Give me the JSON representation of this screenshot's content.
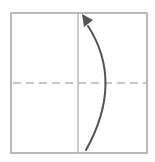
{
  "diagram": {
    "type": "origami-fold-step",
    "colors": {
      "background": "#ffffff",
      "paper_edge": "#a8a8a8",
      "crease_line": "#a8a8a8",
      "fold_line": "#b4b4b4",
      "arrow": "#555555"
    },
    "paper": {
      "x": 11,
      "y": 13,
      "width": 136,
      "height": 140
    },
    "crease": {
      "orientation": "vertical",
      "x": 78,
      "y1": 13,
      "y2": 153,
      "style": "solid"
    },
    "fold_line": {
      "orientation": "horizontal",
      "y": 83,
      "x1": 11,
      "x2": 147,
      "style": "dashed",
      "kind": "valley-fold"
    },
    "arrow": {
      "direction": "up",
      "start": {
        "x": 86,
        "y": 150
      },
      "control": {
        "x": 124,
        "y": 82
      },
      "end": {
        "x": 84,
        "y": 18
      },
      "head_tip": {
        "x": 82,
        "y": 14
      }
    }
  }
}
